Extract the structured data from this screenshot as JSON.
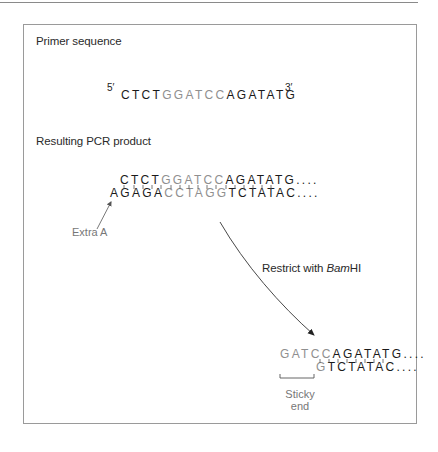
{
  "diagram": {
    "sections": {
      "primer": {
        "heading": "Primer sequence",
        "five_prime": "5′",
        "three_prime": "3′",
        "sequence": [
          {
            "text": "CTCT",
            "tone": "black"
          },
          {
            "text": "GGATCC",
            "tone": "gray"
          },
          {
            "text": "AGATATG",
            "tone": "black"
          }
        ]
      },
      "pcr_product": {
        "heading": "Resulting PCR product",
        "top_strand": [
          {
            "text": "CTCT",
            "tone": "black"
          },
          {
            "text": "GGATCC",
            "tone": "gray"
          },
          {
            "text": "AGATATG....",
            "tone": "black"
          }
        ],
        "bottom_strand": [
          {
            "text": "AGAGA",
            "tone": "black"
          },
          {
            "text": "CCTAGG",
            "tone": "gray"
          },
          {
            "text": "TCTATAC....",
            "tone": "black"
          }
        ],
        "extra_a_label": "Extra A"
      },
      "restriction": {
        "label_prefix": "Restrict with ",
        "enzyme_italic": "Bam",
        "enzyme_suffix": "HI"
      },
      "digested_product": {
        "top_strand": [
          {
            "text": "GATCC",
            "tone": "gray"
          },
          {
            "text": "AGATATG....",
            "tone": "black"
          }
        ],
        "bottom_strand": [
          {
            "text": "G",
            "tone": "gray"
          },
          {
            "text": "TCTATAC....",
            "tone": "black"
          }
        ],
        "sticky_end_label_line1": "Sticky",
        "sticky_end_label_line2": "end"
      }
    },
    "colors": {
      "highlight_gray": "#8f8f8f",
      "text_black": "#1a1a1a",
      "frame_border": "#9a9a9a"
    }
  }
}
